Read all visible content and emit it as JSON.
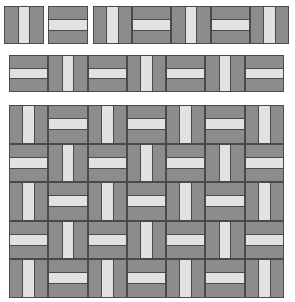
{
  "colors": {
    "tile_dark": "#8c8c8c",
    "tile_light": "#e2e2e2",
    "border": "#4a4a4a"
  },
  "single_tiles": [
    "v",
    "h"
  ],
  "strip_1": [
    "v",
    "h",
    "v",
    "h",
    "v"
  ],
  "strip_2": [
    "h",
    "v",
    "h",
    "v",
    "h",
    "v",
    "h"
  ],
  "grid": {
    "rows": [
      [
        "v",
        "h",
        "v",
        "h",
        "v",
        "h",
        "v"
      ],
      [
        "h",
        "v",
        "h",
        "v",
        "h",
        "v",
        "h"
      ],
      [
        "v",
        "h",
        "v",
        "h",
        "v",
        "h",
        "v"
      ],
      [
        "h",
        "v",
        "h",
        "v",
        "h",
        "v",
        "h"
      ],
      [
        "v",
        "h",
        "v",
        "h",
        "v",
        "h",
        "v"
      ]
    ]
  }
}
